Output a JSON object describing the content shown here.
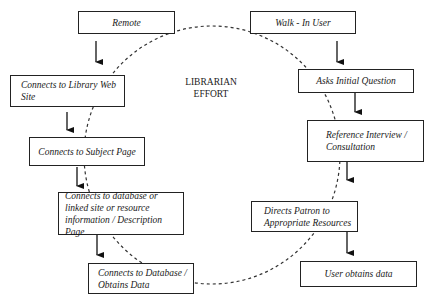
{
  "center_label": {
    "line1": "LIBRARIAN",
    "line2": "EFFORT"
  },
  "remote_path": {
    "start": "Remote",
    "steps": [
      "Connects to Library Web Site",
      "Connects to Subject Page",
      "Connects to database or linked site or resource information / Description Page",
      "Connects to Database / Obtains Data"
    ]
  },
  "walkin_path": {
    "start": "Walk - In User",
    "steps": [
      "Asks Initial Question",
      "Reference Interview / Consultation",
      "Directs Patron to Appropriate Resources",
      "User obtains data"
    ]
  }
}
